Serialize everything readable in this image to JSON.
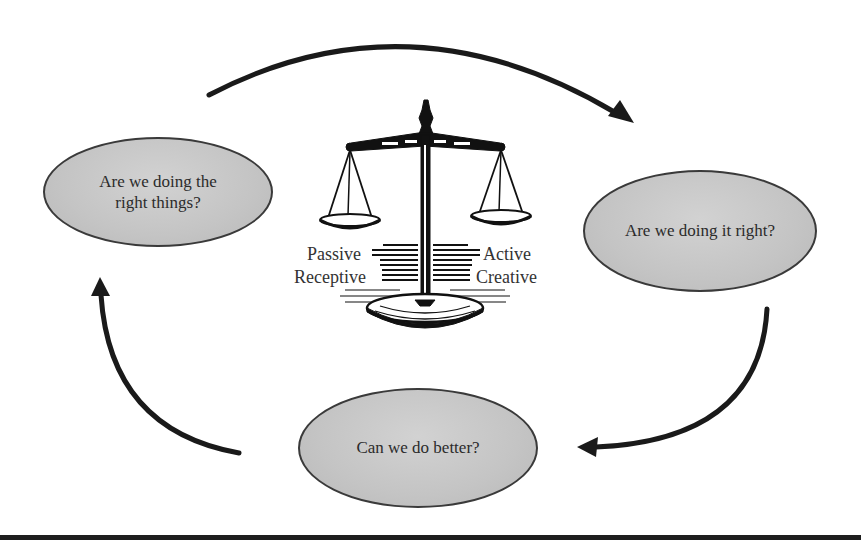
{
  "diagram": {
    "type": "cycle",
    "nodes": [
      {
        "id": "left",
        "label_line1": "Are we doing the",
        "label_line2": "right things?"
      },
      {
        "id": "right",
        "label": "Are we doing it right?"
      },
      {
        "id": "bottom",
        "label": "Can we do better?"
      }
    ],
    "arrows": [
      {
        "from": "left",
        "to": "right",
        "direction": "clockwise"
      },
      {
        "from": "right",
        "to": "bottom",
        "direction": "clockwise"
      },
      {
        "from": "bottom",
        "to": "left",
        "direction": "clockwise"
      }
    ],
    "center_icon": "balance-scale-icon",
    "scale_labels": {
      "left_top": "Passive",
      "left_bottom": "Receptive",
      "right_top": "Active",
      "right_bottom": "Creative"
    },
    "colors": {
      "node_fill": "#c6c6c6",
      "node_border": "#3a3a3a",
      "arrow": "#1a1a1a",
      "rule": "#1e1e1e"
    }
  }
}
